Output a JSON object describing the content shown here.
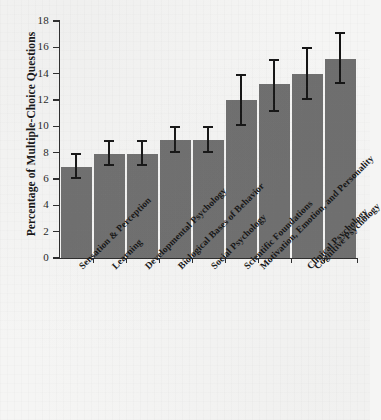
{
  "figure": {
    "background_color": "#f5f5f4",
    "bar_color": "#6e6e6e",
    "error_bar_color": "#141414",
    "axis_color": "#2b2b2b"
  },
  "chart_data": {
    "type": "bar",
    "title": "",
    "subtitle": "",
    "xlabel": "",
    "ylabel": "Percentage of Multiple-Choice Questions",
    "ylim": [
      0,
      18
    ],
    "yticks": [
      0,
      2,
      4,
      6,
      8,
      10,
      12,
      14,
      16,
      18
    ],
    "ytick_labels": [
      "0",
      "2",
      "4",
      "6",
      "8",
      "10",
      "12",
      "14",
      "16",
      "18"
    ],
    "grid": false,
    "legend": null,
    "annotations": [],
    "categories": [
      "Sensation & Perception",
      "Learning",
      "Developmental Psychology",
      "Biological Bases of Behavior",
      "Social Psychology",
      "Scientific Foundations",
      "Motivation, Emotion, and Personality",
      "Clinical Psychology",
      "Cognitive Psychology"
    ],
    "values": [
      6.9,
      7.9,
      7.9,
      9.0,
      9.0,
      12.0,
      13.2,
      14.0,
      15.1
    ],
    "error_low": [
      6.0,
      7.0,
      7.0,
      8.0,
      8.0,
      10.0,
      11.1,
      12.0,
      13.2
    ],
    "error_high": [
      8.0,
      9.0,
      9.0,
      10.0,
      10.0,
      14.0,
      15.1,
      16.0,
      17.2
    ]
  }
}
